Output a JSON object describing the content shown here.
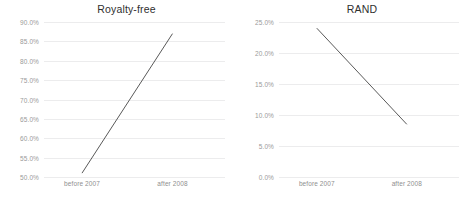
{
  "chart_data": [
    {
      "type": "line",
      "title": "Royalty-free",
      "xlabel": "",
      "ylabel": "",
      "categories": [
        "before 2007",
        "after 2008"
      ],
      "values": [
        0.51,
        0.87
      ],
      "ytick_labels": [
        "90.0%",
        "85.0%",
        "80.0%",
        "75.0%",
        "70.0%",
        "65.0%",
        "60.0%",
        "55.0%",
        "50.0%"
      ],
      "ytick_values": [
        0.9,
        0.85,
        0.8,
        0.75,
        0.7,
        0.65,
        0.6,
        0.55,
        0.5
      ],
      "ylim": [
        0.5,
        0.9
      ],
      "grid": true,
      "legend": false,
      "line_color": "#595959",
      "grid_color": "#ececed"
    },
    {
      "type": "line",
      "title": "RAND",
      "xlabel": "",
      "ylabel": "",
      "categories": [
        "before 2007",
        "after 2008"
      ],
      "values": [
        0.24,
        0.085
      ],
      "ytick_labels": [
        "25.0%",
        "20.0%",
        "15.0%",
        "10.0%",
        "5.0%",
        "0.0%"
      ],
      "ytick_values": [
        0.25,
        0.2,
        0.15,
        0.1,
        0.05,
        0.0
      ],
      "ylim": [
        0.0,
        0.25
      ],
      "grid": true,
      "legend": false,
      "line_color": "#595959",
      "grid_color": "#ececed"
    }
  ]
}
